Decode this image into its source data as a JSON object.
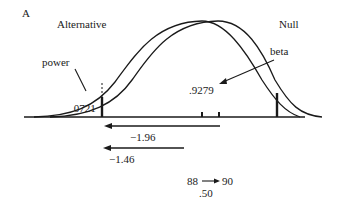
{
  "panel_label": "A",
  "curves": {
    "alternative_label": "Alternative",
    "null_label": "Null"
  },
  "annotations": {
    "power_label": "power",
    "power_value": ".0721",
    "beta_label": "beta",
    "beta_value": ".9279"
  },
  "arrows": {
    "z_critical": "−1.96",
    "z_shift": "−1.46"
  },
  "mean_shift": {
    "from": "88",
    "to": "90",
    "difference": ".50"
  },
  "colors": {
    "line": "#1a1a1a",
    "background": "#ffffff"
  }
}
